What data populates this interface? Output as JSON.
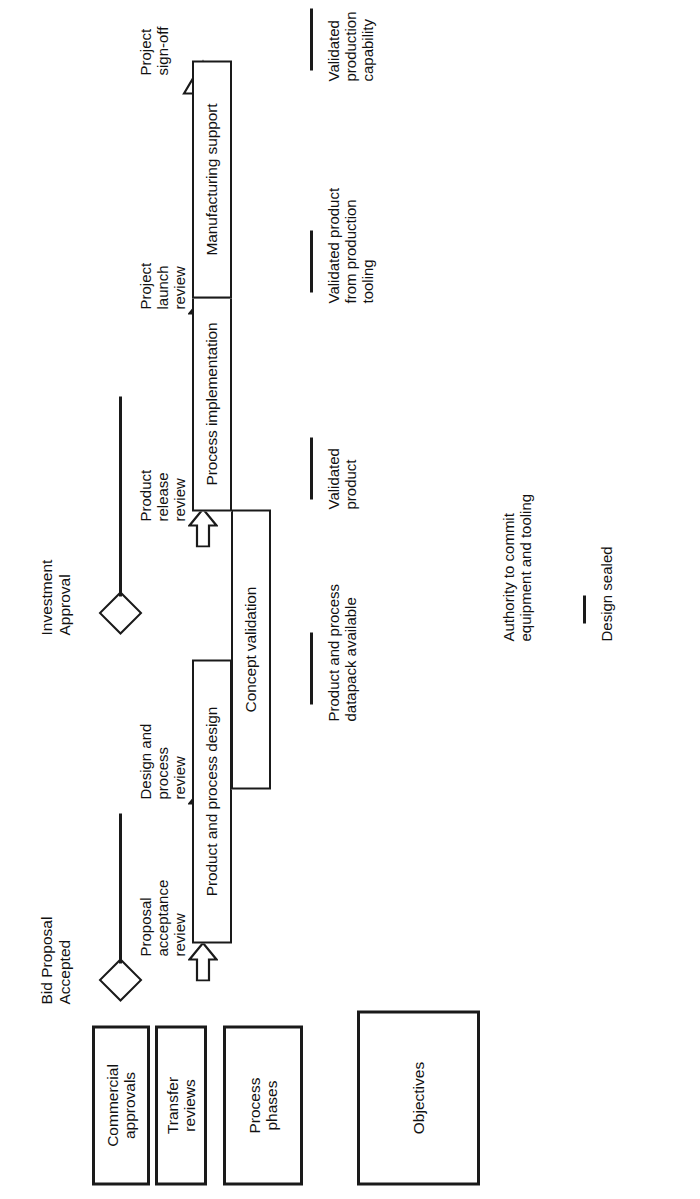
{
  "diagram": {
    "rotation": "90deg-counterclockwise",
    "ink_color": "#1a1a1a",
    "paper_color": "#ffffff"
  },
  "row_labels": [
    {
      "key": "commercial_approvals",
      "text": "Commercial\napprovals"
    },
    {
      "key": "transfer_reviews",
      "text": "Transfer\nreviews"
    },
    {
      "key": "process_phases",
      "text": "Process\nphases"
    },
    {
      "key": "objectives",
      "text": "Objectives"
    }
  ],
  "commercial_approvals": [
    {
      "key": "bid_proposal_accepted",
      "label": "Bid  Proposal\nAccepted",
      "marker": "diamond"
    },
    {
      "key": "investment_approval",
      "label": "Investment\nApproval",
      "marker": "diamond"
    }
  ],
  "transfer_reviews": [
    {
      "key": "proposal_acceptance_review",
      "label": "Proposal\nacceptance\nreview",
      "marker": "block-arrow"
    },
    {
      "key": "design_and_process_review",
      "label": "Design and\nprocess\nreview",
      "marker": "block-arrow"
    },
    {
      "key": "product_release_review",
      "label": "Product\nrelease\nreview",
      "marker": "block-arrow"
    },
    {
      "key": "project_launch_review",
      "label": "Project\nlaunch\nreview",
      "marker": "block-arrow"
    },
    {
      "key": "project_sign_off",
      "label": "Project\nsign-off",
      "marker": "hollow-triangle"
    }
  ],
  "process_phases": [
    {
      "key": "product_and_process_design",
      "label": "Product and process design"
    },
    {
      "key": "concept_validation",
      "label": "Concept validation"
    },
    {
      "key": "process_implementation",
      "label": "Process implementation"
    },
    {
      "key": "manufacturing_support",
      "label": "Manufacturing support"
    }
  ],
  "objectives": [
    {
      "key": "product_and_process_datapack_available",
      "label": "Product and process\ndatapack available"
    },
    {
      "key": "authority_to_commit",
      "label": "Authority to commit\nequipment and tooling"
    },
    {
      "key": "design_sealed",
      "label": "Design sealed"
    },
    {
      "key": "validated_product",
      "label": "Validated\nproduct"
    },
    {
      "key": "validated_product_from_production_tooling",
      "label": "Validated product\nfrom production\ntooling"
    },
    {
      "key": "validated_production_capability",
      "label": "Validated\nproduction\ncapability"
    }
  ]
}
